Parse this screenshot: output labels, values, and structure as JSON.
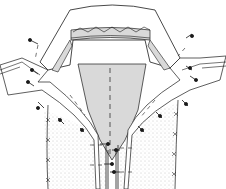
{
  "figure": {
    "colors": {
      "line": "#1a1a1a",
      "shade": "#d9d9d9",
      "fabric": "#ffffff",
      "dots": "#9a9a9a"
    },
    "elements": [
      "collar",
      "collar-band-seam",
      "lapel-left",
      "lapel-right",
      "front-panel-left",
      "front-panel-right",
      "zipper",
      "pins",
      "basting-lines",
      "cross-stitches"
    ]
  }
}
